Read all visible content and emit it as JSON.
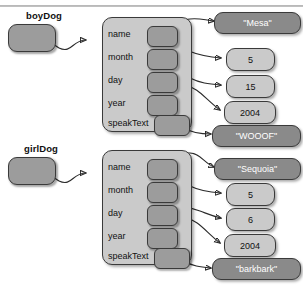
{
  "diagram": {
    "type": "object-reference-diagram",
    "colors": {
      "object_box": "#cacaca",
      "reference_box": "#9c9c9c",
      "slot_box": "#9c9c9c",
      "string_value_box": "#8a8a8a",
      "number_value_box": "#cacaca",
      "outline": "#3a3a3a",
      "string_value_text": "#ffffff",
      "number_value_text": "#111111"
    },
    "field_labels": [
      "name",
      "month",
      "day",
      "year",
      "speakText"
    ],
    "objects": [
      {
        "variable": "boyDog",
        "fields": [
          {
            "label": "name",
            "value": "\"Mesa\"",
            "kind": "string"
          },
          {
            "label": "month",
            "value": "5",
            "kind": "number"
          },
          {
            "label": "day",
            "value": "15",
            "kind": "number"
          },
          {
            "label": "year",
            "value": "2004",
            "kind": "number"
          },
          {
            "label": "speakText",
            "value": "\"WOOOF\"",
            "kind": "string"
          }
        ]
      },
      {
        "variable": "girlDog",
        "fields": [
          {
            "label": "name",
            "value": "\"Sequoia\"",
            "kind": "string"
          },
          {
            "label": "month",
            "value": "5",
            "kind": "number"
          },
          {
            "label": "day",
            "value": "6",
            "kind": "number"
          },
          {
            "label": "year",
            "value": "2004",
            "kind": "number"
          },
          {
            "label": "speakText",
            "value": "\"barkbark\"",
            "kind": "string"
          }
        ]
      }
    ]
  }
}
